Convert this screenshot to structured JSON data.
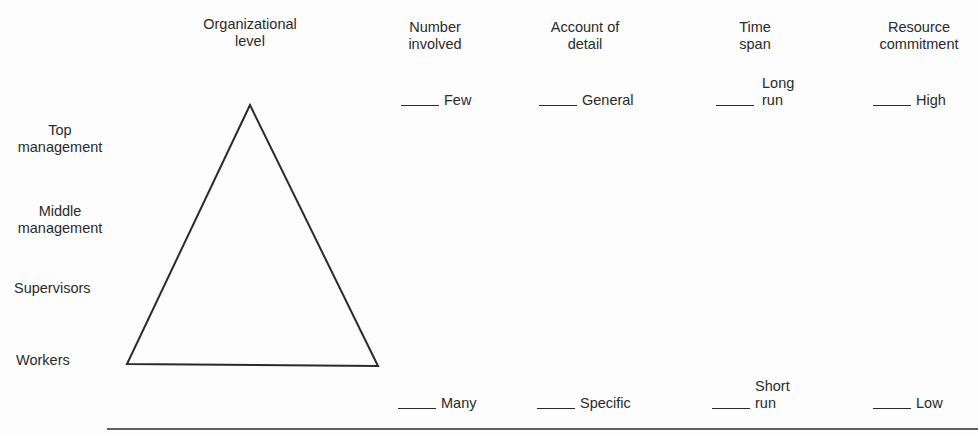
{
  "diagram": {
    "columns": [
      {
        "id": "org-level",
        "header": "Organizational\nlevel"
      },
      {
        "id": "number",
        "header": "Number\ninvolved",
        "top": "Few",
        "bottom": "Many"
      },
      {
        "id": "detail",
        "header": "Account of\ndetail",
        "top": "General",
        "bottom": "Specific"
      },
      {
        "id": "time",
        "header": "Time\nspan",
        "top": "Long\nrun",
        "bottom": "Short\nrun"
      },
      {
        "id": "resource",
        "header": "Resource\ncommitment",
        "top": "High",
        "bottom": "Low"
      }
    ],
    "levels": [
      {
        "label": "Top\nmanagement"
      },
      {
        "label": "Middle\nmanagement"
      },
      {
        "label": "Supervisors"
      },
      {
        "label": "Workers"
      }
    ],
    "shape": "triangle",
    "colors": {
      "ink": "#2a2a2a",
      "background": "#fdfdfd"
    }
  }
}
